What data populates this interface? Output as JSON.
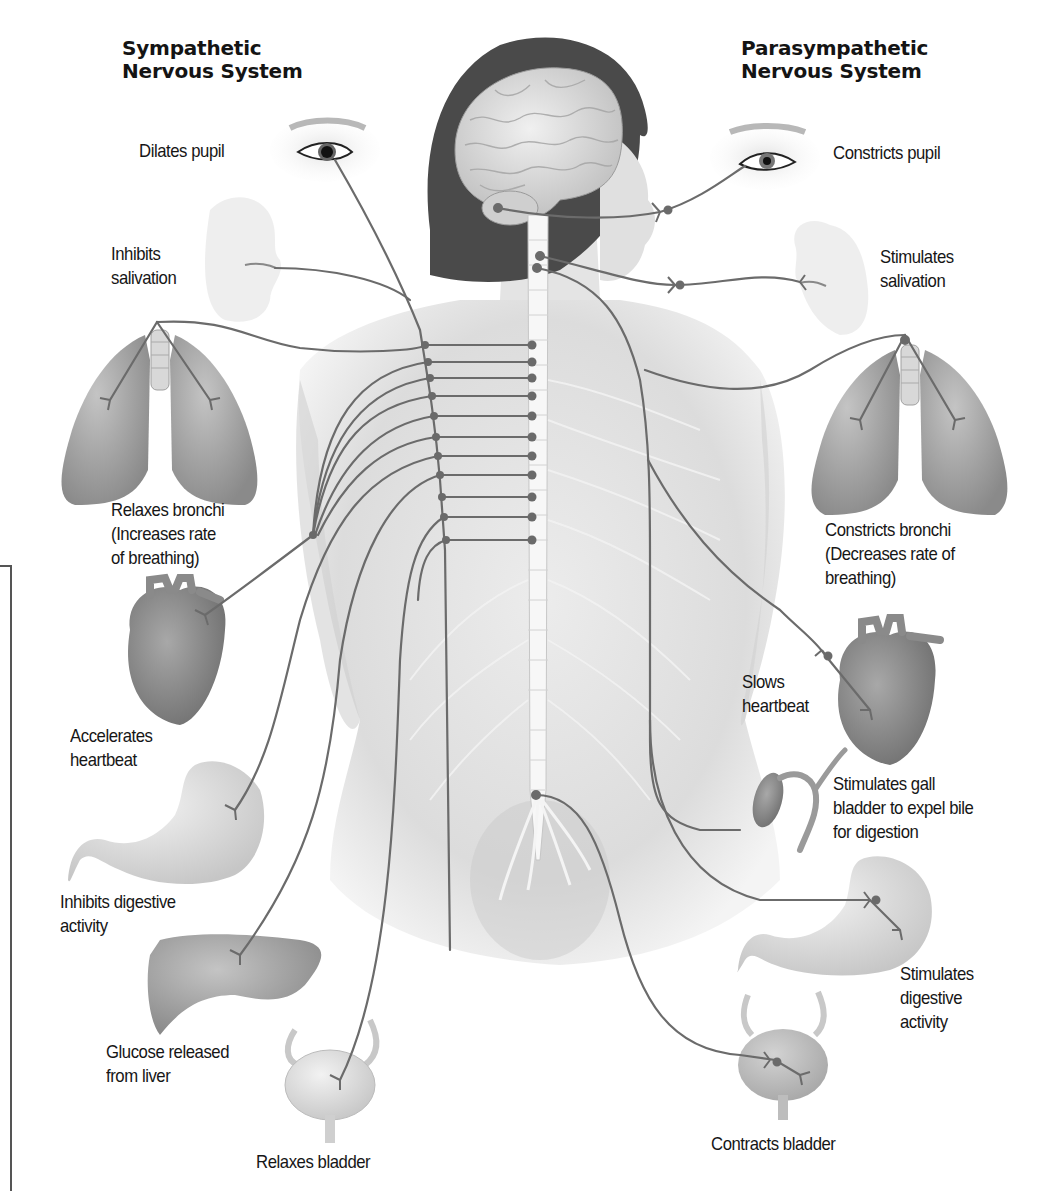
{
  "headings": {
    "sympathetic": {
      "line1": "Sympathetic",
      "line2": "Nervous System"
    },
    "parasympathetic": {
      "line1": "Parasympathetic",
      "line2": "Nervous System"
    }
  },
  "sympathetic_effects": [
    {
      "organ": "eye",
      "lines": [
        "Dilates pupil"
      ]
    },
    {
      "organ": "salivary-glands",
      "lines": [
        "Inhibits",
        "salivation"
      ]
    },
    {
      "organ": "lungs",
      "lines": [
        "Relaxes bronchi",
        "(Increases rate",
        "of breathing)"
      ]
    },
    {
      "organ": "heart",
      "lines": [
        "Accelerates",
        "heartbeat"
      ]
    },
    {
      "organ": "stomach",
      "lines": [
        "Inhibits digestive",
        "activity"
      ]
    },
    {
      "organ": "liver",
      "lines": [
        "Glucose released",
        "from liver"
      ]
    },
    {
      "organ": "bladder",
      "lines": [
        "Relaxes bladder"
      ]
    }
  ],
  "parasympathetic_effects": [
    {
      "organ": "eye",
      "lines": [
        "Constricts pupil"
      ]
    },
    {
      "organ": "salivary-glands",
      "lines": [
        "Stimulates",
        "salivation"
      ]
    },
    {
      "organ": "lungs",
      "lines": [
        "Constricts bronchi",
        "(Decreases rate of",
        "breathing)"
      ]
    },
    {
      "organ": "heart",
      "lines": [
        "Slows",
        "heartbeat"
      ]
    },
    {
      "organ": "gall-bladder",
      "lines": [
        "Stimulates gall",
        "bladder to expel bile",
        "for digestion"
      ]
    },
    {
      "organ": "stomach",
      "lines": [
        "Stimulates",
        "digestive",
        "activity"
      ]
    },
    {
      "organ": "bladder",
      "lines": [
        "Contracts bladder"
      ]
    }
  ],
  "colors": {
    "nerve": "#6b6b6b",
    "ganglion": "#6a6a6a",
    "organ_dark": "#8e8e8e",
    "organ_light": "#d8d8d8",
    "body": "#e6e6e6",
    "hair": "#4a4a4a",
    "text": "#161616"
  }
}
